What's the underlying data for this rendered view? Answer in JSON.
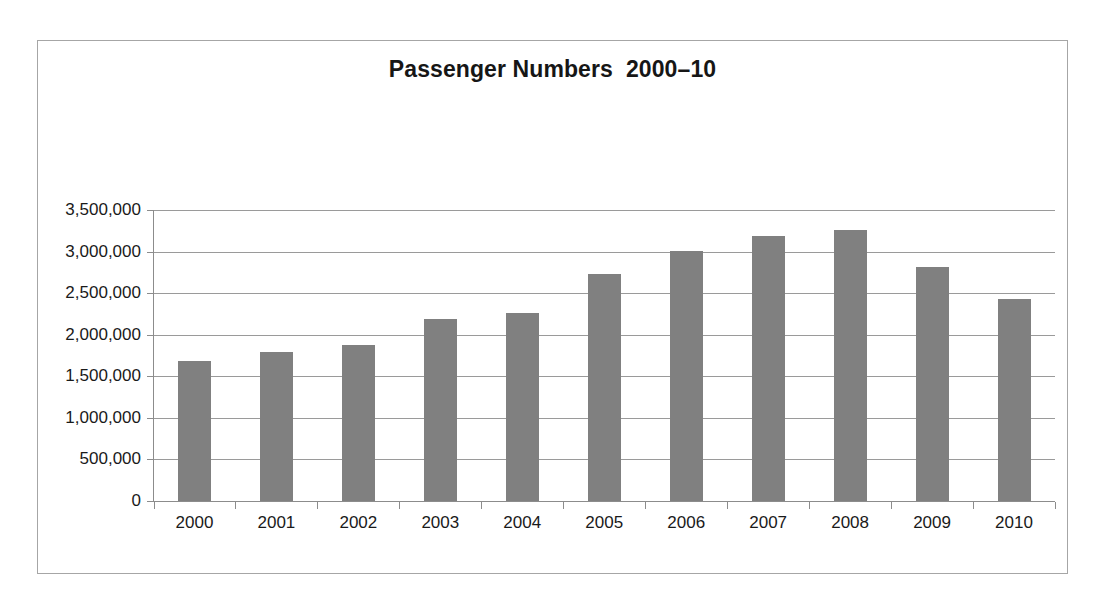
{
  "chart_data": {
    "type": "bar",
    "title": "Passenger Numbers  2000–10",
    "xlabel": "",
    "ylabel": "",
    "categories": [
      "2000",
      "2001",
      "2002",
      "2003",
      "2004",
      "2005",
      "2006",
      "2007",
      "2008",
      "2009",
      "2010"
    ],
    "values": [
      1680000,
      1790000,
      1880000,
      2190000,
      2260000,
      2730000,
      3010000,
      3190000,
      3260000,
      2810000,
      2430000
    ],
    "ylim": [
      0,
      3500000
    ],
    "ytick_values": [
      0,
      500000,
      1000000,
      1500000,
      2000000,
      2500000,
      3000000,
      3500000
    ],
    "ytick_labels": [
      "0",
      "500,000",
      "1,000,000",
      "1,500,000",
      "2,000,000",
      "2,500,000",
      "3,000,000",
      "3,500,000"
    ],
    "grid": true,
    "legend": false,
    "legend_position": "none",
    "series": [
      {
        "name": "Passenger Numbers",
        "color": "#808080",
        "values": [
          1680000,
          1790000,
          1880000,
          2190000,
          2260000,
          2730000,
          3010000,
          3190000,
          3260000,
          2810000,
          2430000
        ]
      }
    ],
    "colors": {
      "bar": "#808080",
      "gridline": "#9a9a9a",
      "axis": "#8c8c8c",
      "frame": "#a6a6a6",
      "text": "#1a1a1a",
      "background": "#ffffff"
    }
  }
}
